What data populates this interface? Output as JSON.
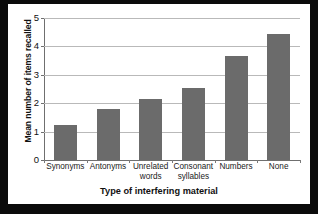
{
  "chart_data": {
    "type": "bar",
    "title": "",
    "xlabel": "Type of interfering material",
    "ylabel": "Mean number of items recalled",
    "categories": [
      "Synonyms",
      "Antonyms",
      "Unrelated words",
      "Consonant syllables",
      "Numbers",
      "None"
    ],
    "category_lines": [
      [
        "Synonyms"
      ],
      [
        "Antonyms"
      ],
      [
        "Unrelated",
        "words"
      ],
      [
        "Consonant",
        "syllables"
      ],
      [
        "Numbers"
      ],
      [
        "None"
      ]
    ],
    "values": [
      1.25,
      1.8,
      2.15,
      2.55,
      3.65,
      4.45
    ],
    "ylim": [
      0,
      5
    ],
    "yticks": [
      0,
      1,
      2,
      3,
      4,
      5
    ],
    "ytick_labels": [
      "0",
      "1",
      "2",
      "3",
      "4",
      "5"
    ],
    "grid": true,
    "legend": false,
    "bar_color": "#6b6b6b",
    "plot_background": "#ffffff",
    "grid_color": "#b9b9b9",
    "axis_color": "#6f6f6f",
    "border_color": "#0b0b0b"
  }
}
